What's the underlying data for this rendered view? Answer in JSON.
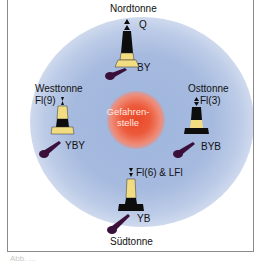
{
  "diagram": {
    "center": {
      "label_line1": "Gefahren-",
      "label_line2": "stelle"
    },
    "buoys": [
      {
        "name": "Nordtonne",
        "light": "Q",
        "colors": "BY"
      },
      {
        "name": "Westtonne",
        "light": "Fl(9)",
        "colors": "YBY"
      },
      {
        "name": "Osttonne",
        "light": "Fl(3)",
        "colors": "BYB"
      },
      {
        "name": "Südtonne",
        "light": "Fl(6) & LFl",
        "colors": "YB"
      }
    ],
    "palette": {
      "yellow": "#f2dc82",
      "black": "#0d0d0d",
      "shadow": "#3a0f3a",
      "halo": "#a6badf",
      "danger": "#e8482a"
    }
  },
  "caption": "Abb. ..."
}
